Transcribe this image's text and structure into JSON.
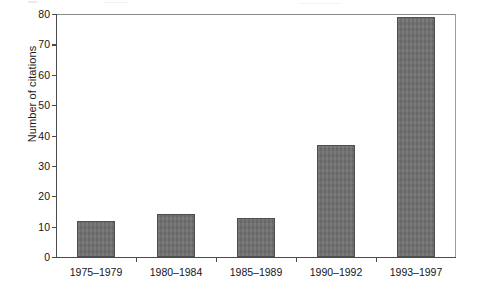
{
  "chart_data": {
    "type": "bar",
    "title": "",
    "subtitle": "",
    "xlabel": "",
    "ylabel": "Number of citations",
    "categories": [
      "1975–1979",
      "1980–1984",
      "1985–1989",
      "1990–1992",
      "1993–1997"
    ],
    "values": [
      12,
      14,
      13,
      37,
      79
    ],
    "ylim": [
      0,
      80
    ],
    "ytick_step": 10,
    "ytick_labels": [
      "0",
      "10",
      "20",
      "30",
      "40",
      "50",
      "60",
      "70",
      "80"
    ],
    "ytick_values": [
      0,
      10,
      20,
      30,
      40,
      50,
      60,
      70,
      80
    ],
    "grid": false,
    "legend": false,
    "legend_position": "none",
    "bar_color": "#6e6e6e",
    "bar_edge_color": "#4f4f4f",
    "axis_color": "#4a4a4a",
    "background_color": "#ffffff",
    "text_color": "#151515"
  }
}
